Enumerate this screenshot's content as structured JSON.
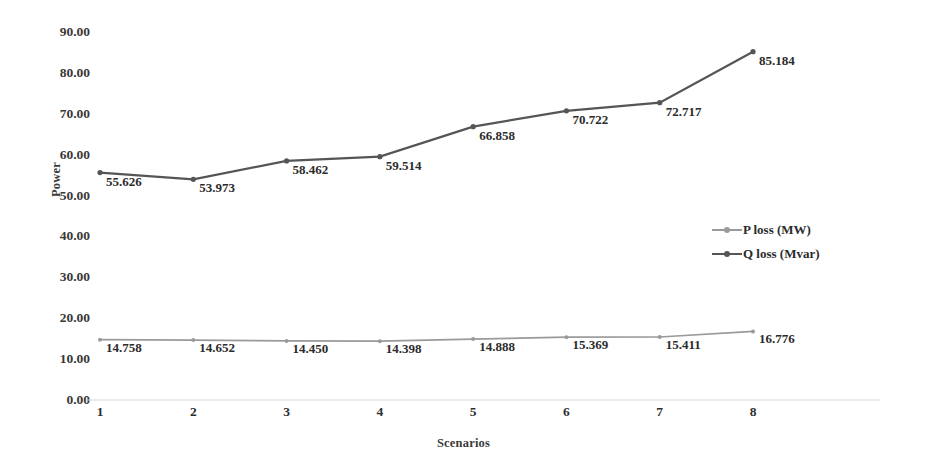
{
  "chart_data": {
    "type": "line",
    "title": "",
    "xlabel": "Scenarios",
    "ylabel": "Power",
    "categories": [
      "1",
      "2",
      "3",
      "4",
      "5",
      "6",
      "7",
      "8"
    ],
    "ylim": [
      0,
      90
    ],
    "ytick_labels": [
      "0.00",
      "10.00",
      "20.00",
      "30.00",
      "40.00",
      "50.00",
      "60.00",
      "70.00",
      "80.00",
      "90.00"
    ],
    "ytick_values": [
      0,
      10,
      20,
      30,
      40,
      50,
      60,
      70,
      80,
      90
    ],
    "grid": false,
    "legend_position": "right-middle",
    "series": [
      {
        "name": "P loss (MW)",
        "color": "#9a9a9a",
        "values": [
          14.758,
          14.652,
          14.45,
          14.398,
          14.888,
          15.369,
          15.411,
          16.776
        ],
        "labels": [
          "14.758",
          "14.652",
          "14.450",
          "14.398",
          "14.888",
          "15.369",
          "15.411",
          "16.776"
        ]
      },
      {
        "name": "Q loss (Mvar)",
        "color": "#555555",
        "values": [
          55.626,
          53.973,
          58.462,
          59.514,
          66.858,
          70.722,
          72.717,
          85.184
        ],
        "labels": [
          "55.626",
          "53.973",
          "58.462",
          "59.514",
          "66.858",
          "70.722",
          "72.717",
          "85.184"
        ]
      }
    ]
  },
  "legend": {
    "items": [
      {
        "label": "P loss (MW)",
        "color": "#9a9a9a"
      },
      {
        "label": "Q loss (Mvar)",
        "color": "#555555"
      }
    ]
  },
  "axis": {
    "x_title": "Scenarios",
    "y_title": "Power"
  }
}
